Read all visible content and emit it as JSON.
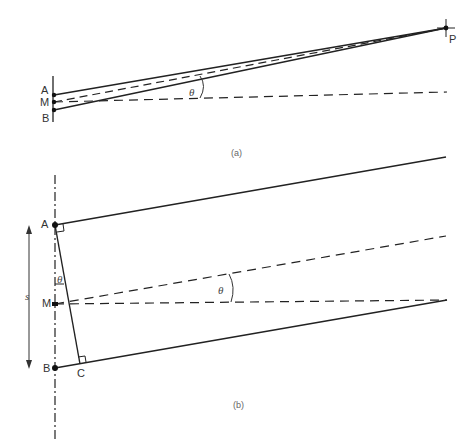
{
  "figure_a": {
    "caption": "(a)",
    "labels": {
      "A": "A",
      "M": "M",
      "B": "B",
      "P": "P",
      "angle": "θ"
    }
  },
  "figure_b": {
    "caption": "(b)",
    "labels": {
      "A": "A",
      "M": "M",
      "B": "B",
      "C": "C",
      "angle": "θ",
      "angle_small": "θ",
      "separation": "s"
    }
  },
  "colors": {
    "line": "#222222",
    "text": "#333333",
    "background": "#ffffff"
  }
}
